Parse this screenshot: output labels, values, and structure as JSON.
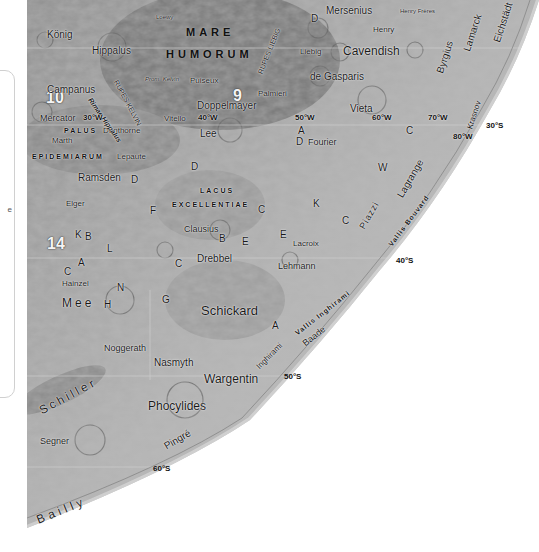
{
  "side_panel": {
    "fragment_text": "e"
  },
  "map": {
    "maria": [
      {
        "id": "mare-humorum-1",
        "label": "MARE"
      },
      {
        "id": "mare-humorum-2",
        "label": "HUMORUM"
      },
      {
        "id": "palus",
        "label": "PALUS"
      },
      {
        "id": "epidemiarum",
        "label": "EPIDEMIARUM"
      },
      {
        "id": "lacus",
        "label": "LACUS"
      },
      {
        "id": "excellentiae",
        "label": "EXCELLENTIAE"
      }
    ],
    "region_numbers": [
      "9",
      "10",
      "14"
    ],
    "craters": {
      "konig": "König",
      "loewy": "Loewy",
      "hippalus": "Hippalus",
      "campanus": "Campanus",
      "mercator": "Mercator",
      "martin": "Marth",
      "dunthorne": "Dunthorne",
      "lepaute": "Lepaute",
      "ramsden": "Ramsden",
      "elger": "Elger",
      "puiseux": "Puiseux",
      "doppelmayer": "Doppelmayer",
      "vitello": "Vitello",
      "lee": "Lee",
      "palmieri": "Palmieri",
      "mersenius": "Mersenius",
      "henry_freres": "Henry Frères",
      "henry": "Henry",
      "liebig": "Liebig",
      "cavendish": "Cavendish",
      "de_gasparis": "de Gasparis",
      "vieta": "Vieta",
      "fourier": "Fourier",
      "byrgius": "Byrgius",
      "lamarck": "Lamarck",
      "eichstadt": "Eichstädt",
      "kasner": "Krasnov",
      "clausius": "Clausius",
      "drebbel": "Drebbel",
      "lacroix": "Lacroix",
      "lehmann": "Lehmann",
      "hainzel": "Hainzel",
      "mee": "Mee",
      "schickard": "Schickard",
      "noggerath": "Noggerath",
      "nasmyth": "Nasmyth",
      "wargentin": "Wargentin",
      "phocylides": "Phocylides",
      "segner": "Segner",
      "pingre": "Pingré",
      "schiller": "Schiller",
      "bailly": "Bailly",
      "piazzi": "Piazzi",
      "lagrange": "Lagrange",
      "inghirami": "Inghirami",
      "baade": "Baade",
      "zupus": "Zupus"
    },
    "features": {
      "rimae_hippalus": "Rimae Hippalus",
      "rupes_kelvin": "RUPES KELVIN",
      "promontorium_kelvin": "Prom. Kelvin",
      "rupes_liebig": "RUPES LIEBIG",
      "vallis_bouvard": "Vallis Bouvard",
      "vallis_inghirami": "Vallis Inghirami",
      "rimae_mersenius": "Rimae",
      "montes_cordillera": "Montes Cordillera",
      "bettinus": "Rook / Cordillera"
    },
    "satellite_letters": [
      "D",
      "A",
      "D",
      "D",
      "C",
      "K",
      "W",
      "C",
      "C",
      "F",
      "K",
      "B",
      "C",
      "A",
      "N",
      "H",
      "G",
      "L",
      "C",
      "B",
      "E",
      "E",
      "A",
      "D"
    ],
    "grid_labels": {
      "lon_30w": "30°W",
      "lon_40w": "40°W",
      "lon_50w": "50°W",
      "lon_60w": "60°W",
      "lon_70w": "70°W",
      "lon_80w": "80°W",
      "lat_30s": "30°S",
      "lat_40s": "40°S",
      "lat_50s": "50°S",
      "lat_60s": "60°S"
    },
    "colors": {
      "mare_dark": "#6e6e6e",
      "highland": "#a9a9a9",
      "limb": "#d8d8d8",
      "background": "#ffffff"
    }
  }
}
